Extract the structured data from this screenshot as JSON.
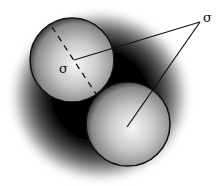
{
  "diagram": {
    "title": "",
    "labels": {
      "sigma_outer": "σ",
      "sigma_inner": "σ"
    },
    "elements": {
      "halo": {
        "cx": 100,
        "cy": 96,
        "r": 90
      },
      "sphere_1": {
        "cx": 72,
        "cy": 60,
        "r": 42
      },
      "sphere_2": {
        "cx": 128,
        "cy": 124,
        "r": 42
      },
      "label_outer_pos": [
        203,
        22
      ],
      "label_inner_pos": [
        59,
        73
      ]
    },
    "colors": {
      "background": "#ffffff",
      "shadow": "#000000",
      "sphere_highlight": "#f4f4f4",
      "sphere_edge": "#1a1a1a",
      "line": "#111111"
    }
  }
}
